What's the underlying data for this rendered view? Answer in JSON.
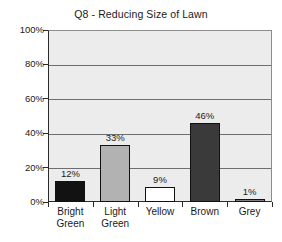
{
  "chart_data": {
    "type": "bar",
    "title": "Q8 - Reducing Size of Lawn",
    "xlabel": "",
    "ylabel": "",
    "ylim": [
      0,
      100
    ],
    "yticks": [
      "0%",
      "20%",
      "40%",
      "60%",
      "80%",
      "100%"
    ],
    "ytick_values": [
      0,
      20,
      40,
      60,
      80,
      100
    ],
    "grid": "horizontal",
    "legend": "none",
    "categories": [
      "Bright Green",
      "Light Green",
      "Yellow",
      "Brown",
      "Grey"
    ],
    "category_lines": [
      [
        "Bright",
        "Green"
      ],
      [
        "Light",
        "Green"
      ],
      [
        "Yellow",
        ""
      ],
      [
        "Brown",
        ""
      ],
      [
        "Grey",
        ""
      ]
    ],
    "values": [
      12,
      33,
      9,
      46,
      1
    ],
    "value_labels": [
      "12%",
      "33%",
      "9%",
      "46%",
      "1%"
    ],
    "bar_colors": [
      "#121212",
      "#b2b2b2",
      "#ffffff",
      "#3a3a3a",
      "#808080"
    ],
    "plot_background": "#ececec",
    "gridline_color": "#6e6e6e",
    "axis_color": "#2b2b2b",
    "text_color": "#1a1a1a"
  }
}
